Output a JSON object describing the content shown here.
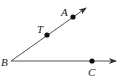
{
  "diagram": {
    "type": "geometry-angle",
    "vertex": {
      "label": "B",
      "x": 11,
      "y": 61
    },
    "rays": [
      {
        "name": "ray-BA",
        "from": "B",
        "to": {
          "x": 86,
          "y": 8
        },
        "points": [
          "T",
          "A"
        ]
      },
      {
        "name": "ray-BC",
        "from": "B",
        "to": {
          "x": 116,
          "y": 61
        },
        "points": [
          "C"
        ]
      }
    ],
    "points": {
      "T": {
        "label": "T",
        "x": 47,
        "y": 35
      },
      "A": {
        "label": "A",
        "x": 73,
        "y": 17
      },
      "C": {
        "label": "C",
        "x": 92,
        "y": 61
      }
    },
    "labels": {
      "B": "B",
      "T": "T",
      "A": "A",
      "C": "C"
    },
    "colors": {
      "line": "#444444",
      "point": "#111111"
    }
  }
}
